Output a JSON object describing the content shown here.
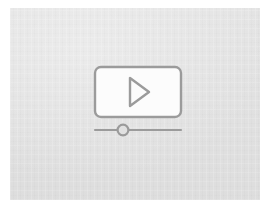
{
  "canvas": {
    "label": "Video placeholder graphic",
    "background_color": "#e1e1e1",
    "page_color": "#ffffff",
    "width": 274,
    "height": 212
  },
  "glyph": {
    "name": "video-player-placeholder",
    "stroke_color": "#9b9b9b",
    "screen_fill_color": "#fcfcfc",
    "screen": {
      "name": "video-screen",
      "x": 10,
      "y": 7,
      "width": 86,
      "height": 50,
      "corner_radius": 6,
      "stroke_width": 2.4
    },
    "play_triangle": {
      "name": "play-triangle",
      "points": "45,18 45,46 64,32",
      "stroke_width": 2.4,
      "filled": false
    },
    "slider": {
      "name": "progress-slider",
      "track": {
        "x1": 10,
        "x2": 96,
        "y": 70,
        "stroke_width": 2.2
      },
      "knob": {
        "name": "slider-knob",
        "cx": 38,
        "cy": 70,
        "r": 5.4,
        "stroke_width": 2.2,
        "fill": "#e1e1e1"
      },
      "value_percent": 33
    }
  },
  "accessibility": {
    "alt_text": "Grey placeholder image showing a video player screen with a play button and a progress slider"
  }
}
